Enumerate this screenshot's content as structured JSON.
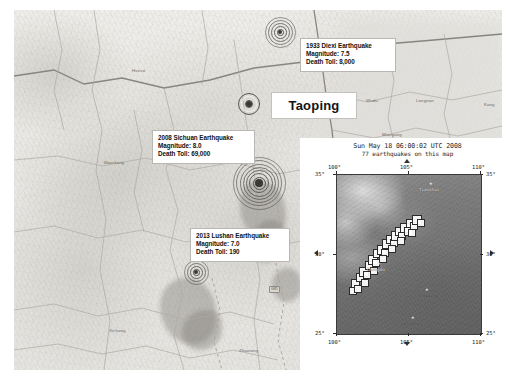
{
  "main_map": {
    "name": "sichuan-terrain-map",
    "place_labels": [
      {
        "text": "Hezuo",
        "x": 118,
        "y": 58
      },
      {
        "text": "Minxian",
        "x": 300,
        "y": 55
      },
      {
        "text": "Wudu",
        "x": 352,
        "y": 88
      },
      {
        "text": "Longnan",
        "x": 402,
        "y": 88
      },
      {
        "text": "Kang",
        "x": 470,
        "y": 92
      },
      {
        "text": "Maerkang",
        "x": 90,
        "y": 150
      },
      {
        "text": "Tazhen",
        "x": 300,
        "y": 105
      },
      {
        "text": "Mianyang",
        "x": 368,
        "y": 122
      },
      {
        "text": "Deyang",
        "x": 300,
        "y": 158
      },
      {
        "text": "Chengdu",
        "x": 296,
        "y": 186
      },
      {
        "text": "Ya'an",
        "x": 200,
        "y": 243
      },
      {
        "text": "Leshan",
        "x": 258,
        "y": 248
      },
      {
        "text": "Nanchong",
        "x": 396,
        "y": 184
      },
      {
        "text": "Suining",
        "x": 350,
        "y": 214
      },
      {
        "text": "Neijiang",
        "x": 330,
        "y": 252
      },
      {
        "text": "Zigong",
        "x": 296,
        "y": 268
      },
      {
        "text": "Yibin",
        "x": 300,
        "y": 302
      },
      {
        "text": "Luzhou",
        "x": 362,
        "y": 288
      },
      {
        "text": "Xichang",
        "x": 95,
        "y": 318
      },
      {
        "text": "Zhaotong",
        "x": 225,
        "y": 338
      },
      {
        "text": "Panzhihua",
        "x": 60,
        "y": 360
      },
      {
        "text": "Kunming",
        "x": 150,
        "y": 372
      },
      {
        "text": "Guangyuan",
        "x": 400,
        "y": 140
      },
      {
        "text": "Dazhou",
        "x": 452,
        "y": 160
      },
      {
        "text": "Bazhong",
        "x": 420,
        "y": 158
      },
      {
        "text": "Chongqing",
        "x": 448,
        "y": 240
      },
      {
        "text": "Zhangzhou",
        "x": 435,
        "y": 290
      },
      {
        "text": "Pingshan",
        "x": 470,
        "y": 330
      },
      {
        "text": "Huize",
        "x": 150,
        "y": 360
      }
    ],
    "road_shields": [
      {
        "text": "G5",
        "x": 304,
        "y": 247,
        "style": "sq"
      },
      {
        "text": "G42",
        "x": 360,
        "y": 232,
        "style": "plain"
      },
      {
        "text": "G93",
        "x": 404,
        "y": 216,
        "style": "plain"
      },
      {
        "text": "G76",
        "x": 446,
        "y": 178,
        "style": "plain"
      },
      {
        "text": "G65",
        "x": 464,
        "y": 300,
        "style": "sq"
      },
      {
        "text": "G85",
        "x": 255,
        "y": 276,
        "style": "plain"
      }
    ]
  },
  "epicenters": [
    {
      "id": "diexi-1933",
      "name": "epicenter-marker-diexi",
      "x": 280,
      "y": 32,
      "radius": 15,
      "label_x": 300,
      "label_y": 38,
      "label_w": 96,
      "lines": [
        "1933 Diexi Earthquake",
        "Magnitude: 7.5",
        "Death Toll: 8,000"
      ]
    },
    {
      "id": "sichuan-2008",
      "name": "epicenter-marker-sichuan",
      "x": 259,
      "y": 183,
      "radius": 26,
      "label_x": 152,
      "label_y": 130,
      "label_w": 103,
      "lines": [
        "2008 Sichuan Earthquake",
        "Magnitude: 8.0",
        "Death Toll: 69,000"
      ]
    },
    {
      "id": "lushan-2013",
      "name": "epicenter-marker-lushan",
      "x": 196,
      "y": 272,
      "radius": 12,
      "label_x": 190,
      "label_y": 228,
      "label_w": 100,
      "lines": [
        "2013 Lushan Earthquake",
        "Magnitude: 7.0",
        "Death Toll: 190"
      ]
    }
  ],
  "taoping": {
    "label": "Taoping",
    "marker_x": 249,
    "marker_y": 104,
    "box_x": 271,
    "box_y": 92,
    "box_w": 84,
    "box_h": 25
  },
  "inset": {
    "name": "usgs-earthquake-inset-map",
    "title_line1": "Sun May 18 06:00:02 UTC 2008",
    "title_line2": "77 earthquakes on this map",
    "axis": {
      "top_lon": [
        "100°",
        "105°",
        "110°"
      ],
      "bottom_lon": [
        "100°",
        "105°",
        "110°"
      ],
      "left_lat": [
        "35°",
        "30°",
        "25°"
      ],
      "right_lat": [
        "35°",
        "30°",
        "25°"
      ],
      "lon_range": [
        100,
        110
      ],
      "lat_range": [
        25,
        35
      ]
    },
    "place_labels": [
      {
        "text": "Tianshui",
        "x": 82,
        "y": 12,
        "tone": "light"
      },
      {
        "text": "Chengdu",
        "x": 30,
        "y": 92,
        "tone": "light"
      },
      {
        "text": "Chongqing",
        "x": 78,
        "y": 118,
        "tone": "dark"
      },
      {
        "text": "Guiyang",
        "x": 64,
        "y": 146,
        "tone": "dark"
      }
    ],
    "quake_count": 77,
    "quakes": [
      {
        "x": 14,
        "y": 104,
        "s": 7
      },
      {
        "x": 19,
        "y": 98,
        "s": 7
      },
      {
        "x": 22,
        "y": 92,
        "s": 8
      },
      {
        "x": 26,
        "y": 96,
        "s": 6
      },
      {
        "x": 28,
        "y": 86,
        "s": 7
      },
      {
        "x": 31,
        "y": 80,
        "s": 8
      },
      {
        "x": 35,
        "y": 84,
        "s": 6
      },
      {
        "x": 36,
        "y": 74,
        "s": 7
      },
      {
        "x": 40,
        "y": 70,
        "s": 8
      },
      {
        "x": 44,
        "y": 74,
        "s": 6
      },
      {
        "x": 45,
        "y": 64,
        "s": 8
      },
      {
        "x": 49,
        "y": 60,
        "s": 7
      },
      {
        "x": 53,
        "y": 64,
        "s": 6
      },
      {
        "x": 54,
        "y": 56,
        "s": 8
      },
      {
        "x": 58,
        "y": 52,
        "s": 7
      },
      {
        "x": 61,
        "y": 57,
        "s": 6
      },
      {
        "x": 63,
        "y": 48,
        "s": 8
      },
      {
        "x": 67,
        "y": 52,
        "s": 7
      },
      {
        "x": 69,
        "y": 44,
        "s": 7
      },
      {
        "x": 73,
        "y": 47,
        "s": 6
      },
      {
        "x": 75,
        "y": 40,
        "s": 8
      },
      {
        "x": 80,
        "y": 44,
        "s": 6
      },
      {
        "x": 12,
        "y": 112,
        "s": 6
      },
      {
        "x": 17,
        "y": 110,
        "s": 6
      },
      {
        "x": 24,
        "y": 104,
        "s": 6
      },
      {
        "x": 33,
        "y": 92,
        "s": 6
      },
      {
        "x": 42,
        "y": 80,
        "s": 6
      },
      {
        "x": 51,
        "y": 70,
        "s": 6
      },
      {
        "x": 60,
        "y": 62,
        "s": 6
      },
      {
        "x": 71,
        "y": 54,
        "s": 6
      }
    ]
  }
}
